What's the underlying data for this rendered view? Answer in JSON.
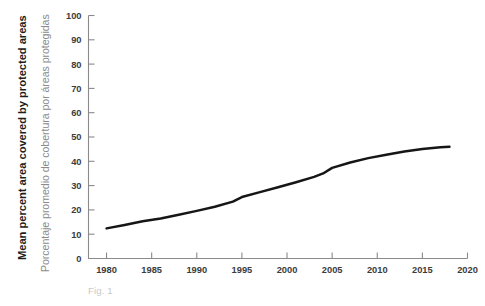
{
  "figure": {
    "caption": "Fig. 1",
    "axis_titles": {
      "y_en": "Mean percent area covered by protected areas",
      "y_es": "Porcentaje promedio de cobertura por áreas protegidas"
    },
    "colors": {
      "line": "#161616",
      "axis": "#8a8a8a",
      "tick_label": "#3c3c3b",
      "label_en": "#1d1d1b",
      "label_es": "#8b8b8b",
      "caption": "#c9c9c9",
      "background": "#ffffff"
    }
  },
  "chart_data": {
    "type": "line",
    "title": "",
    "subtitle": "",
    "xlabel": "",
    "ylabel": "Mean percent area covered by protected areas",
    "ylabel_es": "Porcentaje promedio de cobertura por áreas protegidas",
    "xlim": [
      1978,
      2020
    ],
    "ylim": [
      0,
      100
    ],
    "xticks": [
      1980,
      1985,
      1990,
      1995,
      2000,
      2005,
      2010,
      2015,
      2020
    ],
    "xtick_labels": [
      "1980",
      "1985",
      "1990",
      "1995",
      "2000",
      "2005",
      "2010",
      "2015",
      "2020"
    ],
    "yticks": [
      0,
      10,
      20,
      30,
      40,
      50,
      60,
      70,
      80,
      90,
      100
    ],
    "ytick_labels": [
      "0",
      "10",
      "20",
      "30",
      "40",
      "50",
      "60",
      "70",
      "80",
      "90",
      "100"
    ],
    "grid": false,
    "legend": false,
    "legend_position": "none",
    "annotations": [
      "Fig. 1"
    ],
    "series": [
      {
        "name": "Mean percent area covered by protected areas",
        "color": "#161616",
        "x": [
          1980,
          1982,
          1984,
          1986,
          1988,
          1990,
          1992,
          1994,
          1995,
          1997,
          1999,
          2001,
          2003,
          2004,
          2005,
          2007,
          2009,
          2011,
          2013,
          2015,
          2017,
          2018
        ],
        "values": [
          12.4,
          13.8,
          15.3,
          16.5,
          18.0,
          19.6,
          21.3,
          23.4,
          25.3,
          27.3,
          29.3,
          31.4,
          33.6,
          35.0,
          37.3,
          39.5,
          41.3,
          42.7,
          44.0,
          45.1,
          45.8,
          46.0
        ]
      }
    ]
  }
}
